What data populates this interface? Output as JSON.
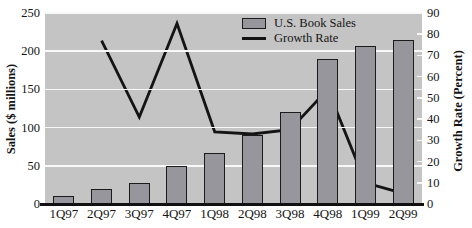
{
  "chart_data": {
    "type": "bar",
    "subtype": "combo-bar-line",
    "categories": [
      "1Q97",
      "2Q97",
      "3Q97",
      "4Q97",
      "1Q98",
      "2Q98",
      "3Q98",
      "4Q98",
      "1Q99",
      "2Q99"
    ],
    "series": [
      {
        "name": "U.S. Book Sales",
        "type": "bar",
        "axis": "left",
        "values": [
          10,
          20,
          28,
          50,
          67,
          90,
          120,
          190,
          207,
          215
        ]
      },
      {
        "name": "Growth Rate",
        "type": "line",
        "axis": "right",
        "values": [
          null,
          77,
          41,
          85,
          34,
          33,
          35,
          54,
          10,
          5
        ]
      }
    ],
    "left_axis": {
      "label": "Sales ($ millions)",
      "min": 0,
      "max": 250,
      "ticks": [
        0,
        50,
        100,
        150,
        200,
        250
      ]
    },
    "right_axis": {
      "label": "Growth Rate (Percent)",
      "min": 0,
      "max": 90,
      "ticks": [
        0,
        10,
        20,
        30,
        40,
        50,
        60,
        70,
        80,
        90
      ]
    },
    "legend": {
      "position": "inside-top-right",
      "items": [
        "U.S. Book Sales",
        "Growth Rate"
      ]
    },
    "grid": "horizontal-white-lines-at-left-ticks",
    "colors": {
      "plot_background": "#c4c4c4",
      "bar_fill": "#96969c",
      "bar_border": "#1b1b1b",
      "gridline": "#f8f8f8",
      "growth_line": "#141414",
      "text": "#141414",
      "page_background": "#ffffff"
    }
  }
}
